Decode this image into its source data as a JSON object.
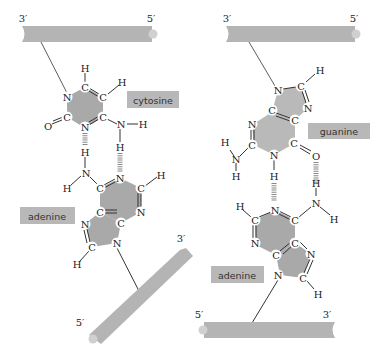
{
  "colors": {
    "backbone": "#b4b4b4",
    "ring": "#a9a9a9",
    "ring_light": "#b9b9b9",
    "label_box": "#b8b8b8",
    "atom_bg": "#ffffff",
    "text": "#222222"
  },
  "panels": [
    {
      "name": "cytosine-adenine-pair",
      "strand_top": {
        "left_end": "3′",
        "right_end": "5′"
      },
      "strand_bottom": {
        "left_end": "5′",
        "right_end": "3′"
      },
      "top_base": {
        "name": "cytosine",
        "atoms": [
          "N",
          "C",
          "H",
          "C",
          "H",
          "C",
          "N",
          "H",
          "N",
          "C",
          "O",
          "H"
        ]
      },
      "bottom_base": {
        "name": "adenine",
        "atoms": [
          "N",
          "H",
          "C",
          "N",
          "C",
          "H",
          "N",
          "C",
          "C",
          "N",
          "C",
          "H",
          "N"
        ]
      },
      "hbonds": 2
    },
    {
      "name": "guanine-adenine-pair",
      "strand_top": {
        "left_end": "3′",
        "right_end": "5′"
      },
      "strand_bottom": {
        "left_end": "5′",
        "right_end": "3′"
      },
      "top_base": {
        "name": "guanine",
        "atoms": [
          "N",
          "C",
          "H",
          "N",
          "C",
          "C",
          "N",
          "C",
          "N",
          "H",
          "H",
          "C",
          "N",
          "H",
          "C",
          "O"
        ]
      },
      "bottom_base": {
        "name": "adenine",
        "atoms": [
          "H",
          "N",
          "C",
          "H",
          "C",
          "N",
          "H",
          "H",
          "N",
          "C",
          "C",
          "N",
          "C",
          "N",
          "C",
          "H"
        ]
      },
      "hbonds": 2
    }
  ],
  "labels": {
    "cytosine": "cytosine",
    "adenine_left": "adenine",
    "guanine": "guanine",
    "adenine_right": "adenine",
    "three_prime": "3′",
    "five_prime": "5′"
  }
}
